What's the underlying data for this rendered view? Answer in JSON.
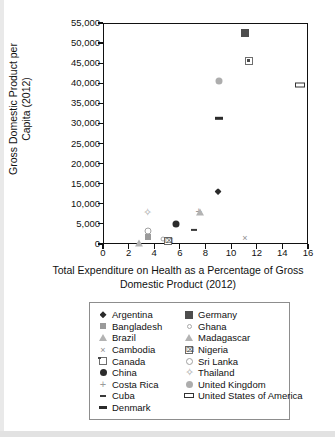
{
  "chart_data": {
    "type": "scatter",
    "title": "",
    "xlabel": "Total Expenditure on Health as a Percentage of Gross Domestic Product (2012)",
    "ylabel": "Gross Domestic Product per Capita (2012)",
    "xlim": [
      0,
      16
    ],
    "ylim": [
      0,
      55000
    ],
    "xticks": [
      "0",
      "2",
      "4",
      "6",
      "8",
      "10",
      "12",
      "14",
      "16"
    ],
    "xtick_values": [
      0,
      2,
      4,
      6,
      8,
      10,
      12,
      14,
      16
    ],
    "yticks": [
      "0",
      "5,000",
      "10,000",
      "15,000",
      "20,000",
      "25,000",
      "30,000",
      "35,000",
      "40,000",
      "45,000",
      "50,000",
      "55,000"
    ],
    "ytick_values": [
      0,
      5000,
      10000,
      15000,
      20000,
      25000,
      30000,
      35000,
      40000,
      45000,
      50000,
      55000
    ],
    "grid": false,
    "legend_position": "below-plot",
    "points": [
      {
        "name": "Germany",
        "x": 11.0,
        "y": 52800,
        "marker": "square-dark"
      },
      {
        "name": "Canada",
        "x": 11.3,
        "y": 45800,
        "marker": "square-dot"
      },
      {
        "name": "United Kingdom",
        "x": 9.0,
        "y": 40900,
        "marker": "circle-gray"
      },
      {
        "name": "United States of America",
        "x": 15.3,
        "y": 39800,
        "marker": "rect-open"
      },
      {
        "name": "Denmark",
        "x": 9.0,
        "y": 31500,
        "marker": "dash-long"
      },
      {
        "name": "Argentina",
        "x": 8.9,
        "y": 13300,
        "marker": "diamond-filled"
      },
      {
        "name": "Costa Rica",
        "x": 7.4,
        "y": 8500,
        "marker": "plus"
      },
      {
        "name": "Brazil",
        "x": 7.5,
        "y": 8100,
        "marker": "triangle-open"
      },
      {
        "name": "Thailand",
        "x": 3.4,
        "y": 8100,
        "marker": "diamond-plus"
      },
      {
        "name": "China",
        "x": 5.6,
        "y": 5200,
        "marker": "circle-filled"
      },
      {
        "name": "Cuba",
        "x": 7.0,
        "y": 3700,
        "marker": "dash-short"
      },
      {
        "name": "Sri Lanka",
        "x": 3.4,
        "y": 3500,
        "marker": "circle-open"
      },
      {
        "name": "Bangladesh",
        "x": 3.4,
        "y": 1900,
        "marker": "square-gray"
      },
      {
        "name": "Cambodia",
        "x": 11.0,
        "y": 1800,
        "marker": "x"
      },
      {
        "name": "Ghana",
        "x": 4.6,
        "y": 1600,
        "marker": "circle-open-sm"
      },
      {
        "name": "Nigeria",
        "x": 5.0,
        "y": 1100,
        "marker": "square-x"
      },
      {
        "name": "Madagascar",
        "x": 2.7,
        "y": 600,
        "marker": "triangle-open"
      }
    ],
    "legend_column_1": [
      {
        "label": "Argentina",
        "marker": "diamond-filled"
      },
      {
        "label": "Bangladesh",
        "marker": "square-gray"
      },
      {
        "label": "Brazil",
        "marker": "triangle-open"
      },
      {
        "label": "Cambodia",
        "marker": "x"
      },
      {
        "label": "Canada",
        "marker": "square-dot"
      },
      {
        "label": "China",
        "marker": "circle-filled"
      },
      {
        "label": "Costa Rica",
        "marker": "plus"
      },
      {
        "label": "Cuba",
        "marker": "dash-short"
      },
      {
        "label": "Denmark",
        "marker": "dash-long"
      }
    ],
    "legend_column_2": [
      {
        "label": "Germany",
        "marker": "square-dark"
      },
      {
        "label": "Ghana",
        "marker": "circle-open-sm"
      },
      {
        "label": "Madagascar",
        "marker": "triangle-open"
      },
      {
        "label": "Nigeria",
        "marker": "square-x"
      },
      {
        "label": "Sri Lanka",
        "marker": "circle-open"
      },
      {
        "label": "Thailand",
        "marker": "diamond-plus"
      },
      {
        "label": "United Kingdom",
        "marker": "circle-gray"
      },
      {
        "label": "United States of America",
        "marker": "rect-open"
      }
    ]
  }
}
